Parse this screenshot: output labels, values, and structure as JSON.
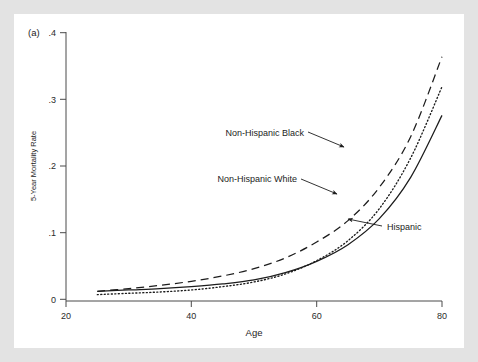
{
  "figure": {
    "panel_label": "(a)",
    "background": "#ffffff",
    "page_background": "#e3e3e3"
  },
  "chart_data": {
    "type": "line",
    "title": "",
    "xlabel": "Age",
    "ylabel": "5-Year Mortality Rate",
    "xlim": [
      20,
      80
    ],
    "ylim": [
      0,
      0.4
    ],
    "grid": false,
    "legend_position": "inline-annotations",
    "xticks": [
      20,
      40,
      60,
      80
    ],
    "xtick_labels": [
      "20",
      "40",
      "60",
      "80"
    ],
    "yticks": [
      0,
      0.1,
      0.2,
      0.3,
      0.4
    ],
    "ytick_labels": [
      "0",
      ".1",
      ".2",
      ".3",
      ".4"
    ],
    "x": [
      25,
      30,
      35,
      40,
      45,
      50,
      55,
      60,
      65,
      70,
      75,
      80
    ],
    "series": [
      {
        "name": "Non-Hispanic Black",
        "style": "dashed",
        "color": "#1c1c1c",
        "values": [
          0.012,
          0.016,
          0.021,
          0.027,
          0.035,
          0.046,
          0.062,
          0.086,
          0.118,
          0.168,
          0.244,
          0.364
        ]
      },
      {
        "name": "Non-Hispanic White",
        "style": "dotted",
        "color": "#1c1c1c",
        "values": [
          0.007,
          0.009,
          0.011,
          0.014,
          0.019,
          0.026,
          0.038,
          0.058,
          0.088,
          0.136,
          0.212,
          0.319
        ]
      },
      {
        "name": "Hispanic",
        "style": "solid",
        "color": "#1c1c1c",
        "values": [
          0.012,
          0.014,
          0.016,
          0.019,
          0.023,
          0.029,
          0.04,
          0.057,
          0.082,
          0.121,
          0.183,
          0.276
        ]
      }
    ],
    "annotations": [
      {
        "label": "Non-Hispanic Black",
        "target_series": "Non-Hispanic Black",
        "target_x": 72,
        "target_y": 0.205
      },
      {
        "label": "Non-Hispanic White",
        "target_series": "Non-Hispanic White",
        "target_x": 68,
        "target_y": 0.112
      },
      {
        "label": "Hispanic",
        "target_series": "Hispanic",
        "target_x": 70.5,
        "target_y": 0.127
      }
    ]
  }
}
